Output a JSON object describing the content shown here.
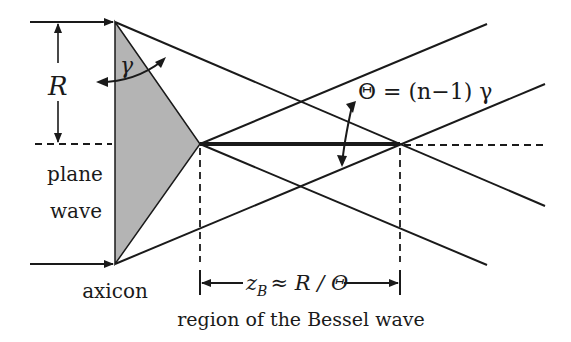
{
  "diagram": {
    "labels": {
      "radius": "R",
      "gamma": "γ",
      "plane_wave_line1": "plane",
      "plane_wave_line2": "wave",
      "axicon": "axicon",
      "theta_formula": "Θ = (n−1) γ",
      "zb_symbol": "z",
      "zb_subscript": "B",
      "zb_formula_rest": "≈ R / Θ",
      "region": "region of the Bessel wave"
    },
    "colors": {
      "ink": "#1a1a1a",
      "axicon_fill": "#b4b4b4",
      "background": "#ffffff"
    }
  }
}
